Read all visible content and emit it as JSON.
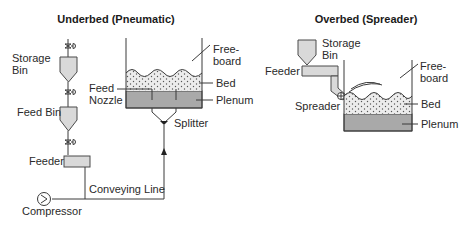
{
  "underbed": {
    "title": "Underbed (Pneumatic)",
    "labels": {
      "storage_bin_1": "Storage",
      "storage_bin_2": "Bin",
      "feed_bin": "Feed Bin",
      "feeder": "Feeder",
      "compressor": "Compressor",
      "conveying_line": "Conveying Line",
      "feed_nozzle_1": "Feed",
      "feed_nozzle_2": "Nozzle",
      "splitter": "Splitter",
      "freeboard_1": "Free-",
      "freeboard_2": "board",
      "bed": "Bed",
      "plenum": "Plenum"
    }
  },
  "overbed": {
    "title": "Overbed (Spreader)",
    "labels": {
      "storage_bin_1": "Storage",
      "storage_bin_2": "Bin",
      "feeder": "Feeder",
      "spreader": "Spreader",
      "freeboard_1": "Free-",
      "freeboard_2": "board",
      "bed": "Bed",
      "plenum": "Plenum"
    }
  },
  "colors": {
    "vessel_fill": "#d9d9d9",
    "plenum_fill": "#a9a9a9",
    "line": "#3a3a3a"
  }
}
